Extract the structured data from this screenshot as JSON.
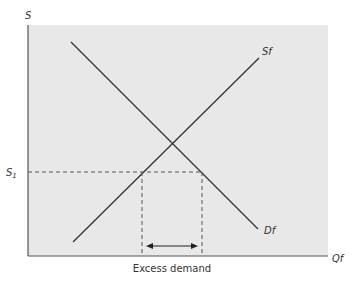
{
  "diagram": {
    "title": "",
    "y_axis_label": "S",
    "x_axis_label": "Qf",
    "supply_label": "Sf",
    "demand_label": "Df",
    "price_level_label": "S",
    "price_level_subscript": "1",
    "gap_label": "Excess demand",
    "colors": {
      "panel_bg": "#e8e8e8",
      "line": "#333333",
      "dashed": "#555555"
    }
  }
}
